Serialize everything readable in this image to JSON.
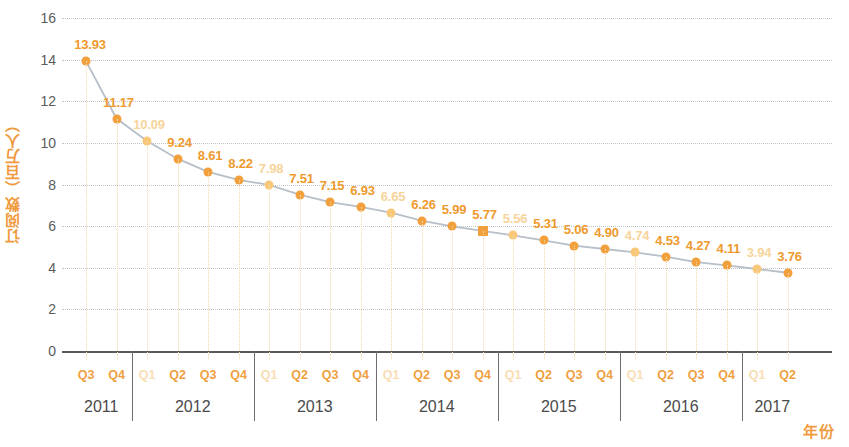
{
  "axes": {
    "y_title": "订阅数（百万人）",
    "x_title": "年份",
    "y_ticks": [
      "0",
      "2",
      "4",
      "6",
      "8",
      "10",
      "12",
      "14",
      "16"
    ]
  },
  "colors": {
    "accent_dark": "#EE9A2E",
    "accent_light": "#F7D49A",
    "marker_dark": "#F2A03C",
    "marker_light": "#F8C778",
    "line": "#B7BFC9",
    "grid": "#b9bcc4",
    "axis": "#5a5a5a",
    "tick_text": "#5c5c5c",
    "year_text": "#4a4a4a"
  },
  "quarter_labels": [
    "Q3",
    "Q4",
    "Q1",
    "Q2",
    "Q3",
    "Q4",
    "Q1",
    "Q2",
    "Q3",
    "Q4",
    "Q1",
    "Q2",
    "Q3",
    "Q4",
    "Q1",
    "Q2",
    "Q3",
    "Q4",
    "Q1",
    "Q2",
    "Q3",
    "Q4",
    "Q1",
    "Q2"
  ],
  "year_labels": [
    "2011",
    "2012",
    "2013",
    "2014",
    "2015",
    "2016",
    "2017"
  ],
  "chart_data": {
    "type": "line",
    "title": "",
    "xlabel": "年份",
    "ylabel": "订阅数（百万人）",
    "ylim": [
      0,
      16
    ],
    "grid": true,
    "legend": "none",
    "categories": [
      "2011 Q3",
      "2011 Q4",
      "2012 Q1",
      "2012 Q2",
      "2012 Q3",
      "2012 Q4",
      "2013 Q1",
      "2013 Q2",
      "2013 Q3",
      "2013 Q4",
      "2014 Q1",
      "2014 Q2",
      "2014 Q3",
      "2014 Q4",
      "2015 Q1",
      "2015 Q2",
      "2015 Q3",
      "2015 Q4",
      "2016 Q1",
      "2016 Q2",
      "2016 Q3",
      "2016 Q4",
      "2017 Q1",
      "2017 Q2"
    ],
    "tick_labels": [
      "Q3",
      "Q4",
      "Q1",
      "Q2",
      "Q3",
      "Q4",
      "Q1",
      "Q2",
      "Q3",
      "Q4",
      "Q1",
      "Q2",
      "Q3",
      "Q4",
      "Q1",
      "Q2",
      "Q3",
      "Q4",
      "Q1",
      "Q2",
      "Q3",
      "Q4",
      "Q1",
      "Q2"
    ],
    "values": [
      13.93,
      11.17,
      10.09,
      9.24,
      8.61,
      8.22,
      7.98,
      7.51,
      7.15,
      6.93,
      6.65,
      6.26,
      5.99,
      5.77,
      5.56,
      5.31,
      5.06,
      4.9,
      4.74,
      4.53,
      4.27,
      4.11,
      3.94,
      3.76
    ],
    "data_labels": [
      "13.93",
      "11.17",
      "10.09",
      "9.24",
      "8.61",
      "8.22",
      "7.98",
      "7.51",
      "7.15",
      "6.93",
      "6.65",
      "6.26",
      "5.99",
      "5.77",
      "5.56",
      "5.31",
      "5.06",
      "4.90",
      "4.74",
      "4.53",
      "4.27",
      "4.11",
      "3.94",
      "3.76"
    ],
    "label_emphasis": [
      "dark",
      "dark",
      "light",
      "dark",
      "dark",
      "dark",
      "light",
      "dark",
      "dark",
      "dark",
      "light",
      "dark",
      "dark",
      "dark",
      "light",
      "dark",
      "dark",
      "dark",
      "light",
      "dark",
      "dark",
      "dark",
      "light",
      "dark"
    ],
    "y_ticks": [
      0,
      2,
      4,
      6,
      8,
      10,
      12,
      14,
      16
    ],
    "year_groups": [
      {
        "year": "2011",
        "quarters": [
          "Q3",
          "Q4"
        ]
      },
      {
        "year": "2012",
        "quarters": [
          "Q1",
          "Q2",
          "Q3",
          "Q4"
        ]
      },
      {
        "year": "2013",
        "quarters": [
          "Q1",
          "Q2",
          "Q3",
          "Q4"
        ]
      },
      {
        "year": "2014",
        "quarters": [
          "Q1",
          "Q2",
          "Q3",
          "Q4"
        ]
      },
      {
        "year": "2015",
        "quarters": [
          "Q1",
          "Q2",
          "Q3",
          "Q4"
        ]
      },
      {
        "year": "2016",
        "quarters": [
          "Q1",
          "Q2",
          "Q3",
          "Q4"
        ]
      },
      {
        "year": "2017",
        "quarters": [
          "Q1",
          "Q2"
        ]
      }
    ]
  }
}
